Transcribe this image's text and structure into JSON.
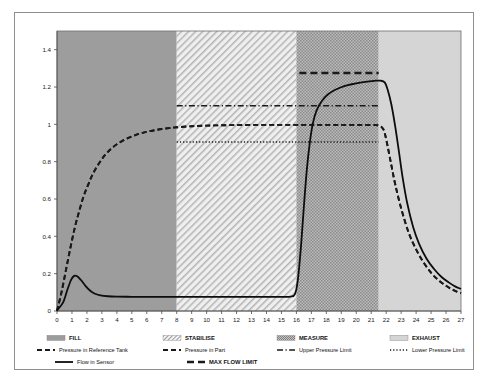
{
  "figure": {
    "title": "",
    "background": "#ffffff",
    "frame_color": "#8e8e8e"
  },
  "chart_data": {
    "type": "line",
    "title": "",
    "xlabel": "",
    "ylabel": "",
    "xlim": [
      0,
      27
    ],
    "ylim": [
      0,
      1.5
    ],
    "grid": false,
    "legend_position": "below",
    "xticks": [
      0,
      1,
      2,
      3,
      4,
      5,
      6,
      7,
      8,
      9,
      10,
      11,
      12,
      13,
      14,
      15,
      16,
      17,
      18,
      19,
      20,
      21,
      22,
      23,
      24,
      25,
      26,
      27
    ],
    "xtick_labels": [
      "0",
      "1",
      "2",
      "3",
      "4",
      "5",
      "6",
      "7",
      "8",
      "9",
      "10",
      "11",
      "12",
      "13",
      "14",
      "15",
      "16",
      "17",
      "18",
      "19",
      "20",
      "21",
      "22",
      "23",
      "24",
      "25",
      "26",
      "27"
    ],
    "yticks": [
      0,
      0.2,
      0.4,
      0.6,
      0.8,
      1,
      1.2,
      1.4
    ],
    "ytick_labels": [
      "0",
      "0.2",
      "0.4",
      "0.6",
      "0.8",
      "1",
      "1.2",
      "1.4"
    ],
    "phases": [
      {
        "name": "FILL",
        "x0": 0,
        "x1": 8,
        "fill": "#9d9d9d",
        "pattern": "solid"
      },
      {
        "name": "STABILISE",
        "x0": 8,
        "x1": 16,
        "fill": "#e9e9e9",
        "pattern": "diagonal"
      },
      {
        "name": "MEASURE",
        "x0": 16,
        "x1": 21.5,
        "fill": "#a8a8a8",
        "pattern": "stipple"
      },
      {
        "name": "EXHAUST",
        "x0": 21.5,
        "x1": 27,
        "fill": "#d5d5d5",
        "pattern": "solid"
      }
    ],
    "series": [
      {
        "name": "Pressure in Reference Tank",
        "style": "dashed",
        "color": "#1a1a1a",
        "width": 1.9,
        "points": [
          [
            0,
            0.0
          ],
          [
            0.3,
            0.1
          ],
          [
            0.6,
            0.22
          ],
          [
            0.9,
            0.34
          ],
          [
            1.2,
            0.45
          ],
          [
            1.5,
            0.54
          ],
          [
            1.8,
            0.62
          ],
          [
            2.1,
            0.68
          ],
          [
            2.4,
            0.735
          ],
          [
            2.8,
            0.79
          ],
          [
            3.2,
            0.835
          ],
          [
            3.6,
            0.868
          ],
          [
            4.0,
            0.893
          ],
          [
            4.5,
            0.917
          ],
          [
            5.0,
            0.935
          ],
          [
            5.5,
            0.949
          ],
          [
            6.0,
            0.96
          ],
          [
            6.5,
            0.968
          ],
          [
            7.0,
            0.975
          ],
          [
            7.5,
            0.98
          ],
          [
            8.0,
            0.984
          ],
          [
            9.0,
            0.99
          ],
          [
            10,
            0.993
          ],
          [
            11,
            0.995
          ],
          [
            12,
            0.996
          ],
          [
            13,
            0.997
          ],
          [
            14,
            0.997
          ],
          [
            15,
            0.997
          ],
          [
            16,
            0.997
          ],
          [
            17,
            0.997
          ],
          [
            18,
            0.997
          ],
          [
            19,
            0.997
          ],
          [
            20,
            0.997
          ],
          [
            21,
            0.996
          ],
          [
            21.5,
            0.994
          ],
          [
            21.8,
            0.975
          ],
          [
            22.0,
            0.92
          ],
          [
            22.3,
            0.8
          ],
          [
            22.6,
            0.68
          ],
          [
            23.0,
            0.55
          ],
          [
            23.5,
            0.42
          ],
          [
            24.0,
            0.33
          ],
          [
            24.5,
            0.26
          ],
          [
            25.0,
            0.205
          ],
          [
            25.5,
            0.165
          ],
          [
            26.0,
            0.135
          ],
          [
            26.5,
            0.112
          ],
          [
            27,
            0.095
          ]
        ]
      },
      {
        "name": "Pressure in Part",
        "style": "dashed",
        "color": "#1a1a1a",
        "width": 1.9,
        "points": [
          [
            0,
            0.0
          ],
          [
            0.3,
            0.1
          ],
          [
            0.6,
            0.22
          ],
          [
            0.9,
            0.34
          ],
          [
            1.2,
            0.45
          ],
          [
            1.5,
            0.54
          ],
          [
            1.8,
            0.62
          ],
          [
            2.1,
            0.68
          ],
          [
            2.4,
            0.735
          ],
          [
            2.8,
            0.79
          ],
          [
            3.2,
            0.835
          ],
          [
            3.6,
            0.868
          ],
          [
            4.0,
            0.893
          ],
          [
            4.5,
            0.917
          ],
          [
            5.0,
            0.935
          ],
          [
            5.5,
            0.949
          ],
          [
            6.0,
            0.96
          ],
          [
            6.5,
            0.968
          ],
          [
            7.0,
            0.975
          ],
          [
            7.5,
            0.98
          ],
          [
            8.0,
            0.984
          ],
          [
            9.0,
            0.99
          ],
          [
            10,
            0.993
          ],
          [
            11,
            0.995
          ],
          [
            12,
            0.996
          ],
          [
            13,
            0.997
          ],
          [
            14,
            0.997
          ],
          [
            15,
            0.997
          ],
          [
            16,
            0.997
          ],
          [
            17,
            0.997
          ],
          [
            18,
            0.997
          ],
          [
            19,
            0.997
          ],
          [
            20,
            0.997
          ],
          [
            21,
            0.996
          ],
          [
            21.5,
            0.994
          ],
          [
            21.8,
            0.975
          ],
          [
            22.0,
            0.92
          ],
          [
            22.3,
            0.8
          ],
          [
            22.6,
            0.68
          ],
          [
            23.0,
            0.55
          ],
          [
            23.5,
            0.42
          ],
          [
            24.0,
            0.33
          ],
          [
            24.5,
            0.26
          ],
          [
            25.0,
            0.205
          ],
          [
            25.5,
            0.165
          ],
          [
            26.0,
            0.135
          ],
          [
            26.5,
            0.112
          ],
          [
            27,
            0.095
          ]
        ]
      },
      {
        "name": "Upper Pressure Limit",
        "style": "dash-dot",
        "color": "#1a1a1a",
        "width": 1.5,
        "value": 1.1,
        "points": [
          [
            8,
            1.1
          ],
          [
            21.5,
            1.1
          ]
        ]
      },
      {
        "name": "Lower Pressure Limit",
        "style": "dotted",
        "color": "#1a1a1a",
        "width": 1.5,
        "value": 0.905,
        "points": [
          [
            8,
            0.905
          ],
          [
            21.5,
            0.905
          ]
        ]
      },
      {
        "name": "Flow in Sensor",
        "style": "solid",
        "color": "#0d0d0d",
        "width": 1.8,
        "points": [
          [
            0,
            0.005
          ],
          [
            0.4,
            0.045
          ],
          [
            0.7,
            0.115
          ],
          [
            0.95,
            0.168
          ],
          [
            1.15,
            0.188
          ],
          [
            1.35,
            0.186
          ],
          [
            1.6,
            0.166
          ],
          [
            1.9,
            0.135
          ],
          [
            2.2,
            0.11
          ],
          [
            2.5,
            0.094
          ],
          [
            2.9,
            0.084
          ],
          [
            3.4,
            0.079
          ],
          [
            4.0,
            0.077
          ],
          [
            5.0,
            0.076
          ],
          [
            6.0,
            0.076
          ],
          [
            7.0,
            0.076
          ],
          [
            8.0,
            0.076
          ],
          [
            9.0,
            0.076
          ],
          [
            10,
            0.076
          ],
          [
            11,
            0.076
          ],
          [
            12,
            0.076
          ],
          [
            13,
            0.076
          ],
          [
            14,
            0.076
          ],
          [
            15,
            0.076
          ],
          [
            15.6,
            0.077
          ],
          [
            15.9,
            0.09
          ],
          [
            16.1,
            0.17
          ],
          [
            16.3,
            0.34
          ],
          [
            16.5,
            0.56
          ],
          [
            16.7,
            0.76
          ],
          [
            16.9,
            0.905
          ],
          [
            17.1,
            1.005
          ],
          [
            17.35,
            1.075
          ],
          [
            17.7,
            1.125
          ],
          [
            18.1,
            1.16
          ],
          [
            18.6,
            1.185
          ],
          [
            19.2,
            1.205
          ],
          [
            19.9,
            1.218
          ],
          [
            20.6,
            1.228
          ],
          [
            21.2,
            1.233
          ],
          [
            21.6,
            1.234
          ],
          [
            21.9,
            1.225
          ],
          [
            22.1,
            1.185
          ],
          [
            22.35,
            1.105
          ],
          [
            22.6,
            0.99
          ],
          [
            22.85,
            0.855
          ],
          [
            23.1,
            0.715
          ],
          [
            23.4,
            0.58
          ],
          [
            23.8,
            0.45
          ],
          [
            24.2,
            0.36
          ],
          [
            24.7,
            0.28
          ],
          [
            25.2,
            0.225
          ],
          [
            25.7,
            0.182
          ],
          [
            26.2,
            0.152
          ],
          [
            26.6,
            0.132
          ],
          [
            27,
            0.118
          ]
        ]
      },
      {
        "name": "MAX FLOW LIMIT",
        "style": "thick-dash",
        "color": "#1a1a1a",
        "width": 2.6,
        "value": 1.275,
        "points": [
          [
            16.2,
            1.275
          ],
          [
            21.5,
            1.275
          ]
        ]
      }
    ]
  },
  "legend": {
    "rows": [
      [
        {
          "label": "FILL",
          "swatch": "solid-gray",
          "color": "#9d9d9d"
        },
        {
          "label": "STABILISE",
          "swatch": "diagonal",
          "color": "#e9e9e9"
        },
        {
          "label": "MEASURE",
          "swatch": "stipple",
          "color": "#a8a8a8"
        },
        {
          "label": "EXHAUST",
          "swatch": "solid-light",
          "color": "#d5d5d5"
        }
      ],
      [
        {
          "label": "Pressure in Reference Tank",
          "swatch": "line-dashed",
          "color": "#1a1a1a"
        },
        {
          "label": "Pressure in Part",
          "swatch": "line-dashed",
          "color": "#1a1a1a"
        },
        {
          "label": "Upper Pressure Limit",
          "swatch": "line-dashdot",
          "color": "#1a1a1a"
        },
        {
          "label": "Lower Pressure Limit",
          "swatch": "line-dotted",
          "color": "#1a1a1a"
        }
      ],
      [
        {
          "label": "Flow in Sensor",
          "swatch": "line-solid",
          "color": "#0d0d0d"
        },
        {
          "label": "MAX FLOW LIMIT",
          "swatch": "line-thick",
          "color": "#1a1a1a"
        }
      ]
    ]
  }
}
